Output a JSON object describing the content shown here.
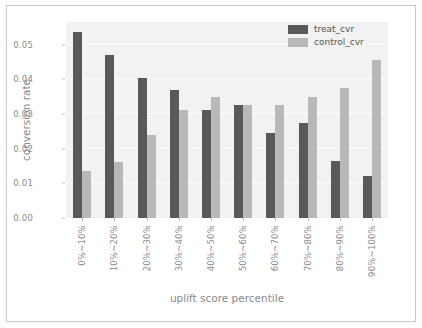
{
  "chart_data": {
    "type": "bar",
    "title": "",
    "xlabel": "uplift score percentile",
    "ylabel": "conversion rate",
    "ylim": [
      0,
      0.0565
    ],
    "yticks": [
      0.0,
      0.01,
      0.02,
      0.03,
      0.04,
      0.05
    ],
    "ytick_labels": [
      "0.00",
      "0.01",
      "0.02",
      "0.03",
      "0.04",
      "0.05"
    ],
    "grid": false,
    "legend_position": "top-right",
    "categories": [
      "0%~10%",
      "10%~20%",
      "20%~30%",
      "30%~40%",
      "40%~50%",
      "50%~60%",
      "60%~70%",
      "70%~80%",
      "80%~90%",
      "90%~100%"
    ],
    "series": [
      {
        "name": "treat_cvr",
        "color": "#595959",
        "values": [
          0.0535,
          0.047,
          0.0405,
          0.037,
          0.031,
          0.0325,
          0.0245,
          0.0275,
          0.0165,
          0.012
        ]
      },
      {
        "name": "control_cvr",
        "color": "#b8b8b8",
        "values": [
          0.0135,
          0.0162,
          0.024,
          0.031,
          0.035,
          0.0325,
          0.0325,
          0.035,
          0.0375,
          0.0455
        ]
      }
    ]
  },
  "legend": {
    "items": [
      {
        "label": "treat_cvr"
      },
      {
        "label": "control_cvr"
      }
    ]
  }
}
